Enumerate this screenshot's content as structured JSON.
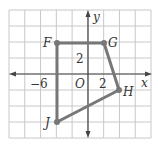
{
  "chart_data": {
    "type": "diagram",
    "title": "",
    "axes": {
      "x_label": "x",
      "y_label": "y",
      "origin_label": "O",
      "x_range": [
        -10,
        8
      ],
      "y_range": [
        -8,
        8
      ],
      "grid_step": 2,
      "grid": true,
      "tick_labels": [
        {
          "axis": "x",
          "value": -6,
          "text": "−6"
        },
        {
          "axis": "x",
          "value": 2,
          "text": "2"
        },
        {
          "axis": "y",
          "value": 2,
          "text": "2"
        }
      ]
    },
    "points": [
      {
        "name": "F",
        "x": -4,
        "y": 4
      },
      {
        "name": "G",
        "x": 2,
        "y": 4
      },
      {
        "name": "H",
        "x": 4,
        "y": -2
      },
      {
        "name": "J",
        "x": -4,
        "y": -6
      }
    ],
    "polygon": [
      "F",
      "G",
      "H",
      "J"
    ]
  },
  "labels": {
    "x_axis": "x",
    "y_axis": "y",
    "origin": "O",
    "tick_neg6": "−6",
    "tick_x2": "2",
    "tick_y2": "2",
    "point_F": "F",
    "point_G": "G",
    "point_H": "H",
    "point_J": "J"
  },
  "colors": {
    "grid": "#c8c8c8",
    "axis": "#444444",
    "polygon": "#777777"
  }
}
